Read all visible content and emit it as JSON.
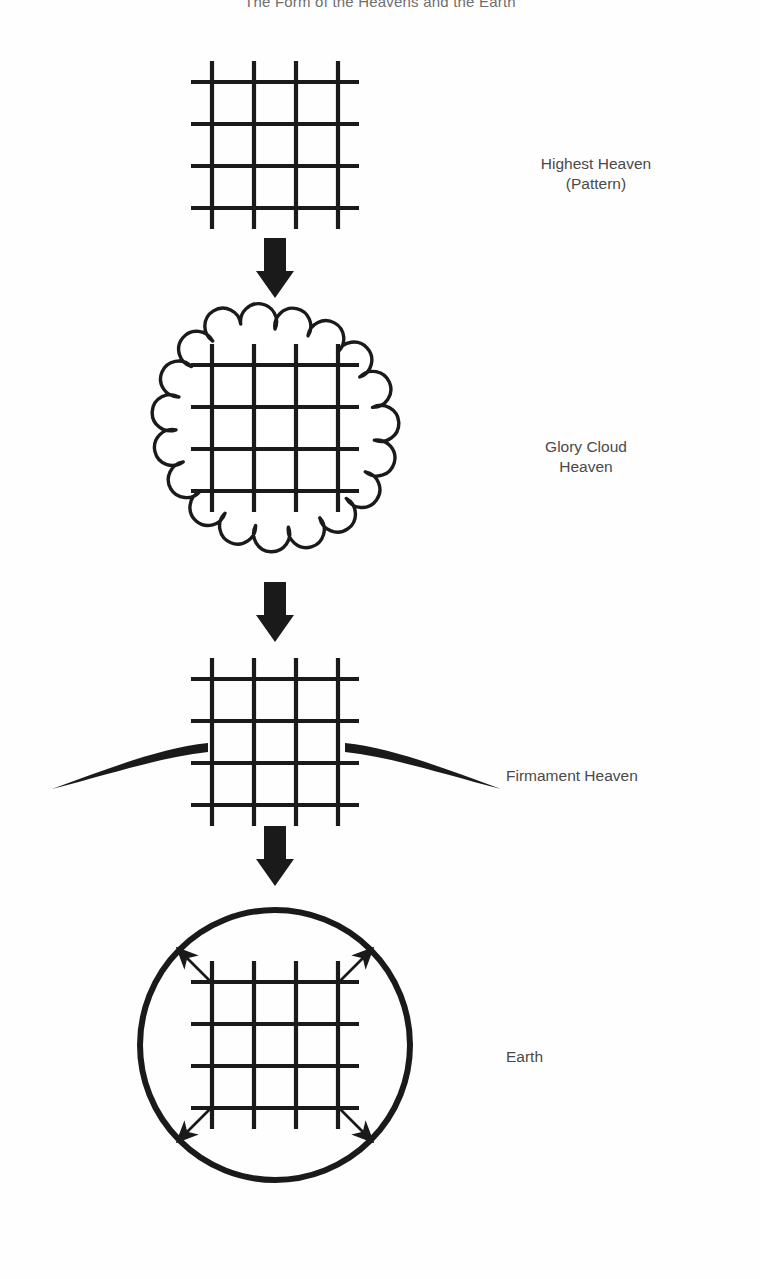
{
  "page": {
    "title": "The Form of the Heavens and the Earth",
    "background_color": "#fefefe",
    "ink_color": "#1a1a1a",
    "label_color": "#4a4a4a",
    "width": 760,
    "height": 1279
  },
  "stages": [
    {
      "id": "highest-heaven",
      "label": "Highest Heaven\n(Pattern)",
      "shape": "grid",
      "description": "bare crosshatch grid of four vertical and four horizontal lines"
    },
    {
      "id": "glory-cloud-heaven",
      "label": "Glory Cloud\nHeaven",
      "shape": "scalloped-cloud-with-grid",
      "description": "grid enclosed in a scalloped cloud circle"
    },
    {
      "id": "firmament-heaven",
      "label": "Firmament Heaven",
      "shape": "grid-with-firmament-arcs",
      "description": "grid flanked by two thick tapering arcs forming the firmament vault"
    },
    {
      "id": "earth",
      "label": "Earth",
      "shape": "circle-with-grid-and-arrows",
      "description": "grid inside a heavy circle with four arrows radiating outward to the rim"
    }
  ],
  "connectors": [
    {
      "id": "arrow-1",
      "from": "highest-heaven",
      "to": "glory-cloud-heaven",
      "glyph": "down-arrow"
    },
    {
      "id": "arrow-2",
      "from": "glory-cloud-heaven",
      "to": "firmament-heaven",
      "glyph": "down-arrow"
    },
    {
      "id": "arrow-3",
      "from": "firmament-heaven",
      "to": "earth",
      "glyph": "down-arrow"
    }
  ],
  "grid": {
    "vertical_lines": 4,
    "horizontal_lines": 4,
    "cell_count": "4x4 crosshatch"
  },
  "earth_arrows": {
    "count": 4,
    "directions": [
      "up-left",
      "up-right",
      "down-left",
      "down-right"
    ]
  }
}
